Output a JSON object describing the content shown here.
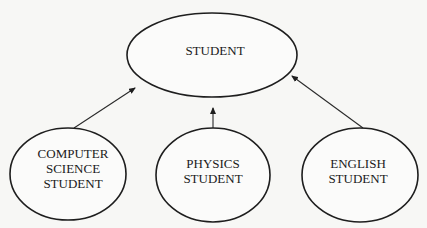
{
  "diagram": {
    "type": "inheritance-hierarchy",
    "colors": {
      "stroke": "#1e1e1e",
      "text": "#1a1a1a",
      "background": "#f7f7f5"
    },
    "nodes": [
      {
        "id": "student",
        "lines": [
          "STUDENT"
        ]
      },
      {
        "id": "cs_student",
        "lines": [
          "COMPUTER",
          "SCIENCE",
          "STUDENT"
        ]
      },
      {
        "id": "physics_student",
        "lines": [
          "PHYSICS",
          "STUDENT"
        ]
      },
      {
        "id": "english_student",
        "lines": [
          "ENGLISH",
          "STUDENT"
        ]
      }
    ],
    "edges": [
      {
        "from": "cs_student",
        "to": "student"
      },
      {
        "from": "physics_student",
        "to": "student"
      },
      {
        "from": "english_student",
        "to": "student"
      }
    ]
  }
}
